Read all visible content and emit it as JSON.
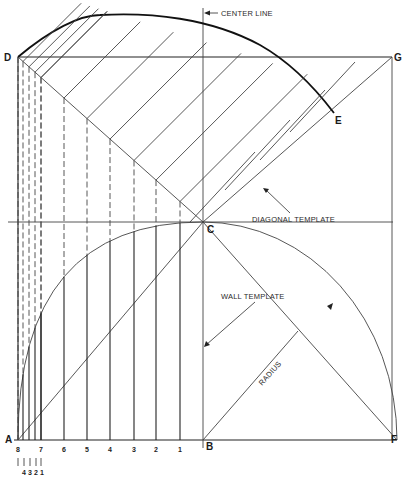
{
  "diagram": {
    "points": {
      "A": "A",
      "B": "B",
      "C": "C",
      "D": "D",
      "E": "E",
      "F": "F",
      "G": "G"
    },
    "annotations": {
      "center_line": "CENTER LINE",
      "diagonal_template": "DIAGONAL TEMPLATE",
      "wall_template": "WALL TEMPLATE",
      "radius": "RADIUS"
    },
    "division_labels": [
      "8",
      "7",
      "6",
      "5",
      "4",
      "3",
      "2",
      "1"
    ],
    "sub_division_labels": [
      "4",
      "3",
      "2",
      "1"
    ]
  }
}
